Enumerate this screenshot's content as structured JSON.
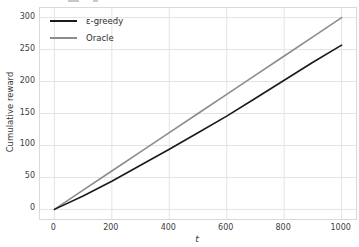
{
  "figure": {
    "background": "#ffffff",
    "plot_background": "#ffffff",
    "grid_color": "#e3e3e3",
    "spine_color": "#d9d9d9",
    "tick_label_color": "#404040",
    "note": "clipped text remnant visible at very top edge (cut-off title from content above)"
  },
  "chart_data": {
    "type": "line",
    "title": "",
    "xlabel": "t",
    "ylabel": "Cumulative reward",
    "xlim": [
      -50,
      1050
    ],
    "ylim": [
      -15,
      315
    ],
    "xticks": [
      0,
      200,
      400,
      600,
      800,
      1000
    ],
    "yticks": [
      0,
      50,
      100,
      150,
      200,
      250,
      300
    ],
    "grid": true,
    "legend_position": "upper left",
    "legend_frame": false,
    "x": [
      0,
      100,
      200,
      300,
      400,
      500,
      600,
      700,
      800,
      900,
      1000
    ],
    "series": [
      {
        "name": "ε-greedy",
        "color": "#1a1a1a",
        "values": [
          0,
          21,
          44,
          69,
          94,
          120,
          146,
          174,
          202,
          230,
          257
        ]
      },
      {
        "name": "Oracle",
        "color": "#8c8c8c",
        "values": [
          0,
          30,
          60,
          90,
          120,
          150,
          180,
          210,
          240,
          270,
          300
        ]
      }
    ]
  }
}
